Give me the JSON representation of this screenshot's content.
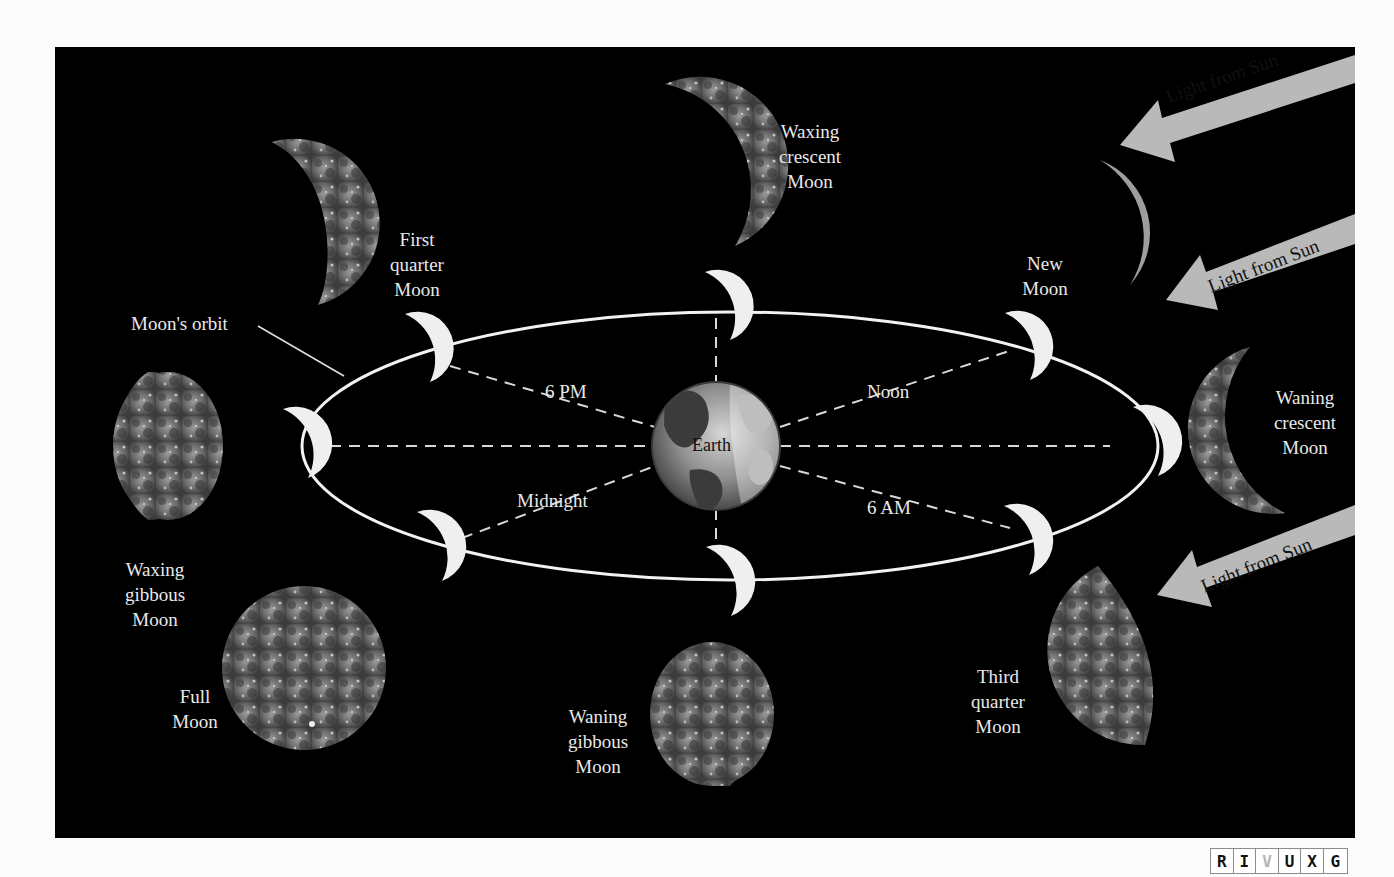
{
  "diagram": {
    "background_color": "#000000",
    "center_label": "Earth",
    "orbit_label": "Moon's orbit",
    "time_labels": {
      "noon": "Noon",
      "six_pm": "6 PM",
      "midnight": "Midnight",
      "six_am": "6 AM"
    },
    "sun_arrows": [
      {
        "label": "Light from Sun"
      },
      {
        "label": "Light from Sun"
      },
      {
        "label": "Light from Sun"
      }
    ],
    "phases": [
      {
        "id": "new",
        "label": "New\nMoon"
      },
      {
        "id": "waxing-crescent",
        "label": "Waxing\ncrescent\nMoon"
      },
      {
        "id": "first-quarter",
        "label": "First\nquarter\nMoon"
      },
      {
        "id": "waxing-gibbous",
        "label": "Waxing\ngibbous\nMoon"
      },
      {
        "id": "full",
        "label": "Full\nMoon"
      },
      {
        "id": "waning-gibbous",
        "label": "Waning\ngibbous\nMoon"
      },
      {
        "id": "third-quarter",
        "label": "Third\nquarter\nMoon"
      },
      {
        "id": "waning-crescent",
        "label": "Waning\ncrescent\nMoon"
      }
    ],
    "colors": {
      "arrow": "#b9b9b9",
      "moon_lit": "#efefef",
      "orbit_line": "#f2f2f2",
      "label_text": "#e9e9e9"
    }
  },
  "badge": {
    "letters": [
      "R",
      "I",
      "V",
      "U",
      "X",
      "G"
    ],
    "active": "V"
  }
}
